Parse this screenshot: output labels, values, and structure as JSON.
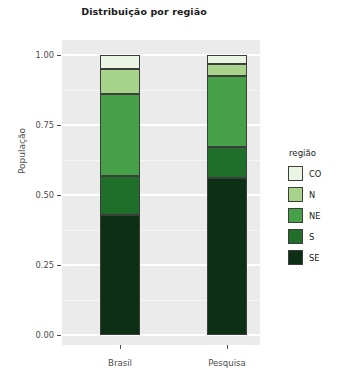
{
  "chart_data": {
    "type": "bar",
    "title": "Distribuição por região",
    "xlabel": "",
    "ylabel": "População",
    "categories": [
      "Brasil",
      "Pesquisa"
    ],
    "ylim": [
      0.0,
      1.0
    ],
    "ytick_labels": [
      "0.00",
      "0.25",
      "0.50",
      "0.75",
      "1.00"
    ],
    "ytick_values": [
      0.0,
      0.25,
      0.5,
      0.75,
      1.0
    ],
    "grid": true,
    "stacked": true,
    "stack_order_bottom_to_top": [
      "SE",
      "S",
      "NE",
      "N",
      "CO"
    ],
    "legend_title": "região",
    "legend_position": "right",
    "series": [
      {
        "name": "CO",
        "color": "#eaf5e2",
        "values": [
          0.05,
          0.032
        ]
      },
      {
        "name": "N",
        "color": "#a7d48a",
        "values": [
          0.09,
          0.043
        ]
      },
      {
        "name": "NE",
        "color": "#45a048",
        "values": [
          0.292,
          0.254
        ]
      },
      {
        "name": "S",
        "color": "#1f6f2a",
        "values": [
          0.139,
          0.11
        ]
      },
      {
        "name": "SE",
        "color": "#0d2f13",
        "values": [
          0.429,
          0.561
        ]
      }
    ]
  },
  "colors": {
    "panel_background": "#ebebeb",
    "gridline": "#ffffff",
    "text": "#4d4d4d",
    "title_text": "#1a1a1a",
    "bar_outline": "#3d3d3d"
  },
  "legend": {
    "title": "região",
    "items": [
      {
        "label": "CO",
        "color": "#eaf5e2"
      },
      {
        "label": "N",
        "color": "#a7d48a"
      },
      {
        "label": "NE",
        "color": "#45a048"
      },
      {
        "label": "S",
        "color": "#1f6f2a"
      },
      {
        "label": "SE",
        "color": "#0d2f13"
      }
    ]
  }
}
